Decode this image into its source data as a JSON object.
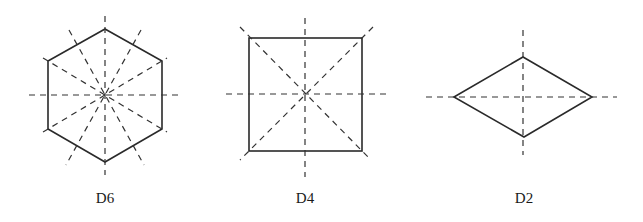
{
  "figures": [
    {
      "label": "D6",
      "shape": "regular hexagon",
      "symmetry_axes": 6
    },
    {
      "label": "D4",
      "shape": "square",
      "symmetry_axes": 4
    },
    {
      "label": "D2",
      "shape": "rhombus",
      "symmetry_axes": 2
    }
  ],
  "colors": {
    "line": "#2a2a2a",
    "background": "#ffffff"
  }
}
